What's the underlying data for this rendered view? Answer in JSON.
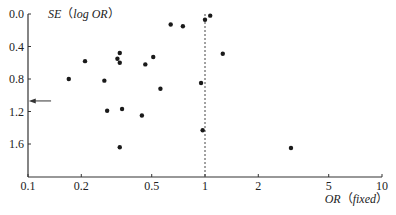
{
  "chart_data": {
    "type": "scatter",
    "subtype": "funnel-plot",
    "title": "",
    "xlabel": "OR（fixed）",
    "xlabel_parts": {
      "var": "OR",
      "open": "（",
      "qual": "fixed",
      "close": "）"
    },
    "ylabel": "SE（log OR）",
    "ylabel_parts": {
      "var": "SE",
      "open": "（",
      "qual": "log OR",
      "close": "）"
    },
    "x_scale": "log",
    "xlim": [
      0.1,
      10
    ],
    "ylim": [
      0.0,
      2.0
    ],
    "y_inverted": true,
    "x_ticks": [
      {
        "value": 0.1,
        "label": "0.1"
      },
      {
        "value": 0.2,
        "label": "0.2"
      },
      {
        "value": 0.5,
        "label": "0.5"
      },
      {
        "value": 1,
        "label": "1"
      },
      {
        "value": 2,
        "label": "2"
      },
      {
        "value": 5,
        "label": "5"
      },
      {
        "value": 10,
        "label": "10"
      }
    ],
    "y_ticks": [
      {
        "value": 0.0,
        "label": "0.0"
      },
      {
        "value": 0.4,
        "label": "0.4"
      },
      {
        "value": 0.8,
        "label": "0.8"
      },
      {
        "value": 1.2,
        "label": "1.2"
      },
      {
        "value": 1.6,
        "label": "1.6"
      }
    ],
    "grid": false,
    "legend": null,
    "reference_line": {
      "x": 1,
      "style": "dashed"
    },
    "annotations": [
      {
        "type": "arrow",
        "pointing": "left",
        "at_se": 1.07,
        "from_or": 0.135,
        "to_or": 0.101
      }
    ],
    "points": [
      {
        "or": 0.17,
        "se": 0.8
      },
      {
        "or": 0.21,
        "se": 0.58
      },
      {
        "or": 0.27,
        "se": 0.82
      },
      {
        "or": 0.28,
        "se": 1.19
      },
      {
        "or": 0.32,
        "se": 0.55
      },
      {
        "or": 0.33,
        "se": 0.48
      },
      {
        "or": 0.33,
        "se": 0.6
      },
      {
        "or": 0.34,
        "se": 1.17
      },
      {
        "or": 0.33,
        "se": 1.64
      },
      {
        "or": 0.44,
        "se": 1.25
      },
      {
        "or": 0.46,
        "se": 0.62
      },
      {
        "or": 0.51,
        "se": 0.53
      },
      {
        "or": 0.56,
        "se": 0.92
      },
      {
        "or": 0.64,
        "se": 0.13
      },
      {
        "or": 0.75,
        "se": 0.15
      },
      {
        "or": 0.95,
        "se": 0.85
      },
      {
        "or": 0.97,
        "se": 1.43
      },
      {
        "or": 1.0,
        "se": 0.07
      },
      {
        "or": 1.07,
        "se": 0.02
      },
      {
        "or": 1.26,
        "se": 0.49
      },
      {
        "or": 3.06,
        "se": 1.65
      }
    ]
  },
  "style": {
    "axis_color": "#333333",
    "point_color": "#1a1a1a",
    "ref_line_color": "#444444"
  }
}
